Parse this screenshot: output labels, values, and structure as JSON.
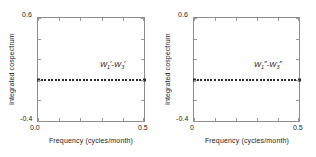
{
  "figure": {
    "background_color": "#ffffff",
    "axis_color": "#8d8d8d",
    "marker_color": "#2b2b2b",
    "text_color": "#242424"
  },
  "panels": [
    {
      "id": "panel-left",
      "annotation": {
        "symbol": "W",
        "sub_a": "1",
        "sub_b": "3",
        "prime": "′",
        "dash": "-"
      },
      "x_title": "Frequency (cycles/month)",
      "y_title": "Integrated cospectrum",
      "x_min_label": "0.0",
      "x_max_label": "0.5",
      "y_min_label": "-0.4",
      "y_max_label": "0.6"
    },
    {
      "id": "panel-right",
      "annotation": {
        "symbol": "W",
        "sub_a": "1",
        "sub_b": "3",
        "prime": "″",
        "dash": "-"
      },
      "x_title": "Frequency (cycles/month)",
      "y_title": "Integrated cospectrum",
      "x_min_label": "0",
      "x_max_label": "0.5",
      "y_min_label": "-0.4",
      "y_max_label": "0.6"
    }
  ],
  "chart_data": [
    {
      "type": "scatter",
      "title": "W₁′-W₃′",
      "xlabel": "Frequency (cycles/month)",
      "ylabel": "Integrated cospectrum",
      "xlim": [
        0.0,
        0.5
      ],
      "ylim": [
        -0.4,
        0.6
      ],
      "xticks": [
        0.0,
        0.1,
        0.2,
        0.3,
        0.4,
        0.5
      ],
      "xticklabels": [
        "0.0",
        "",
        "",
        "",
        "",
        "0.5"
      ],
      "yticks": [
        -0.4,
        -0.2,
        0.0,
        0.2,
        0.4,
        0.6
      ],
      "yticklabels": [
        "-0.4",
        "",
        "",
        "",
        "",
        "0.6"
      ],
      "grid": false,
      "legend": "none",
      "marker": "square",
      "x": [
        0.0,
        0.0167,
        0.0333,
        0.05,
        0.0667,
        0.0833,
        0.1,
        0.1167,
        0.1333,
        0.15,
        0.1667,
        0.1833,
        0.2,
        0.2167,
        0.2333,
        0.25,
        0.2667,
        0.2833,
        0.3,
        0.3167,
        0.3333,
        0.35,
        0.3667,
        0.3833,
        0.4,
        0.4167,
        0.4333,
        0.45,
        0.4667,
        0.4833,
        0.5
      ],
      "y": [
        0.0,
        0.0,
        0.0,
        0.0,
        0.0,
        0.0,
        0.0,
        0.0,
        0.0,
        0.0,
        0.0,
        0.0,
        0.0,
        0.0,
        0.0,
        0.0,
        0.0,
        0.0,
        0.0,
        0.0,
        0.0,
        0.0,
        0.0,
        0.0,
        0.0,
        0.0,
        0.0,
        0.0,
        0.0,
        0.0,
        0.0
      ]
    },
    {
      "type": "scatter",
      "title": "W₁″-W₃″",
      "xlabel": "Frequency (cycles/month)",
      "ylabel": "Integrated cospectrum",
      "xlim": [
        0.0,
        0.5
      ],
      "ylim": [
        -0.4,
        0.6
      ],
      "xticks": [
        0.0,
        0.1,
        0.2,
        0.3,
        0.4,
        0.5
      ],
      "xticklabels": [
        "0",
        "",
        "",
        "",
        "",
        "0.5"
      ],
      "yticks": [
        -0.4,
        -0.2,
        0.0,
        0.2,
        0.4,
        0.6
      ],
      "yticklabels": [
        "-0.4",
        "",
        "",
        "",
        "",
        "0.6"
      ],
      "grid": false,
      "legend": "none",
      "marker": "square",
      "x": [
        0.0,
        0.0167,
        0.0333,
        0.05,
        0.0667,
        0.0833,
        0.1,
        0.1167,
        0.1333,
        0.15,
        0.1667,
        0.1833,
        0.2,
        0.2167,
        0.2333,
        0.25,
        0.2667,
        0.2833,
        0.3,
        0.3167,
        0.3333,
        0.35,
        0.3667,
        0.3833,
        0.4,
        0.4167,
        0.4333,
        0.45,
        0.4667,
        0.4833,
        0.5
      ],
      "y": [
        0.0,
        0.0,
        0.0,
        0.0,
        0.0,
        0.0,
        0.0,
        0.0,
        0.0,
        0.0,
        0.0,
        0.0,
        0.0,
        0.0,
        0.0,
        0.0,
        0.0,
        0.0,
        0.0,
        0.0,
        0.0,
        0.0,
        0.0,
        0.0,
        0.0,
        0.0,
        0.0,
        0.0,
        0.0,
        0.0,
        0.0
      ]
    }
  ]
}
